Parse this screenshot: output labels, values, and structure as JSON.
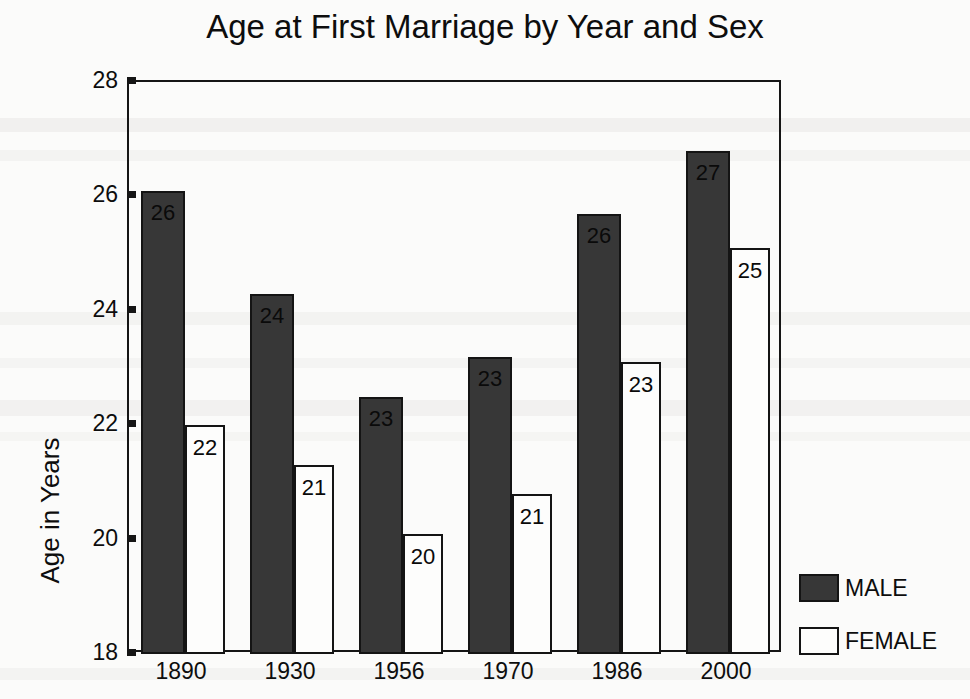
{
  "chart_data": {
    "type": "bar",
    "title": "Age at First Marriage by Year and Sex",
    "xlabel": "",
    "ylabel": "Age in Years",
    "ylim": [
      18,
      28
    ],
    "ytick_step": 2,
    "yticks": [
      28,
      26,
      24,
      22,
      20,
      18
    ],
    "grid": false,
    "legend_position": "right",
    "categories": [
      "1890",
      "1930",
      "1956",
      "1970",
      "1986",
      "2000"
    ],
    "series": [
      {
        "name": "MALE",
        "color": "#373737",
        "values": [
          26.1,
          24.3,
          22.5,
          23.2,
          25.7,
          26.8
        ],
        "labels": [
          "26",
          "24",
          "23",
          "23",
          "26",
          "27"
        ]
      },
      {
        "name": "FEMALE",
        "color": "#fdfdfc",
        "values": [
          22.0,
          21.3,
          20.1,
          20.8,
          23.1,
          25.1
        ],
        "labels": [
          "22",
          "21",
          "20",
          "21",
          "23",
          "25"
        ]
      }
    ]
  },
  "legend": {
    "items": [
      {
        "label": "MALE",
        "swatch": "filled-dark"
      },
      {
        "label": "FEMALE",
        "swatch": "outlined-white"
      }
    ]
  }
}
